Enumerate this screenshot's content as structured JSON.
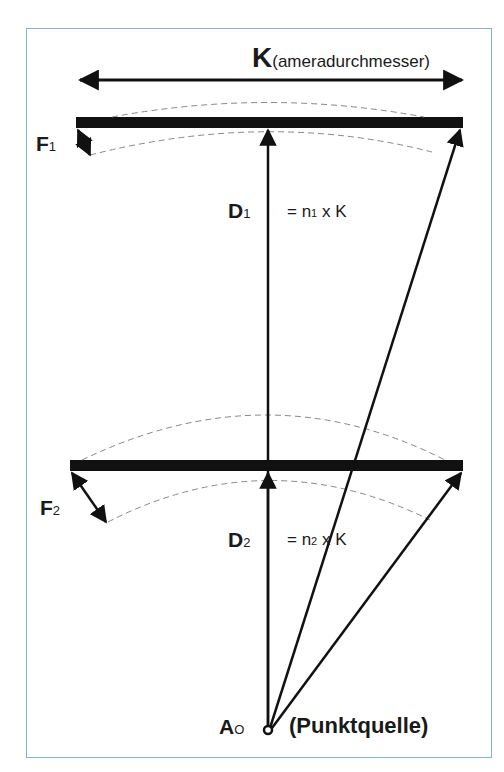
{
  "diagram": {
    "width_label": {
      "main": "K",
      "rest": "(ameradurchmesser)"
    },
    "f1_label": {
      "main": "F",
      "sub": "1"
    },
    "f2_label": {
      "main": "F",
      "sub": "2"
    },
    "d1_label": {
      "main": "D",
      "sub": "1"
    },
    "d2_label": {
      "main": "D",
      "sub": "2"
    },
    "eq1": {
      "pre": "= n",
      "sub": "1",
      "post": " x K"
    },
    "eq2": {
      "pre": "= n",
      "sub": "2",
      "post": " x K"
    },
    "source_label": {
      "main": "A",
      "sub": "O",
      "rest": "(Punktquelle)"
    },
    "colors": {
      "frame": "#7fb8cc",
      "ink": "#111111",
      "dashed": "#888888"
    }
  }
}
